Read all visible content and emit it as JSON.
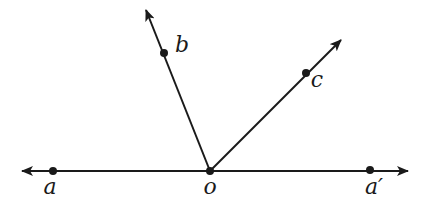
{
  "diagram": {
    "type": "geometry-rays",
    "stroke_color": "#1a1a1a",
    "line": {
      "name": "line-aa-prime",
      "from": [
        22,
        171
      ],
      "to": [
        408,
        171
      ],
      "arrows": [
        "start",
        "end"
      ]
    },
    "rays": [
      {
        "name": "ray-ob",
        "from": [
          210,
          171
        ],
        "to": [
          146,
          10
        ]
      },
      {
        "name": "ray-oc",
        "from": [
          210,
          171
        ],
        "to": [
          341,
          40
        ]
      }
    ],
    "points": [
      {
        "id": "a",
        "label": "a",
        "x": 53,
        "y": 171,
        "label_x": 50,
        "label_y": 194
      },
      {
        "id": "o",
        "label": "o",
        "x": 210,
        "y": 171,
        "label_x": 210,
        "label_y": 194
      },
      {
        "id": "a_prime",
        "label": "a′",
        "x": 370,
        "y": 170,
        "label_x": 374,
        "label_y": 194
      },
      {
        "id": "b",
        "label": "b",
        "x": 164,
        "y": 53,
        "label_x": 182,
        "label_y": 52
      },
      {
        "id": "c",
        "label": "c",
        "x": 306,
        "y": 73,
        "label_x": 317,
        "label_y": 87
      }
    ]
  }
}
